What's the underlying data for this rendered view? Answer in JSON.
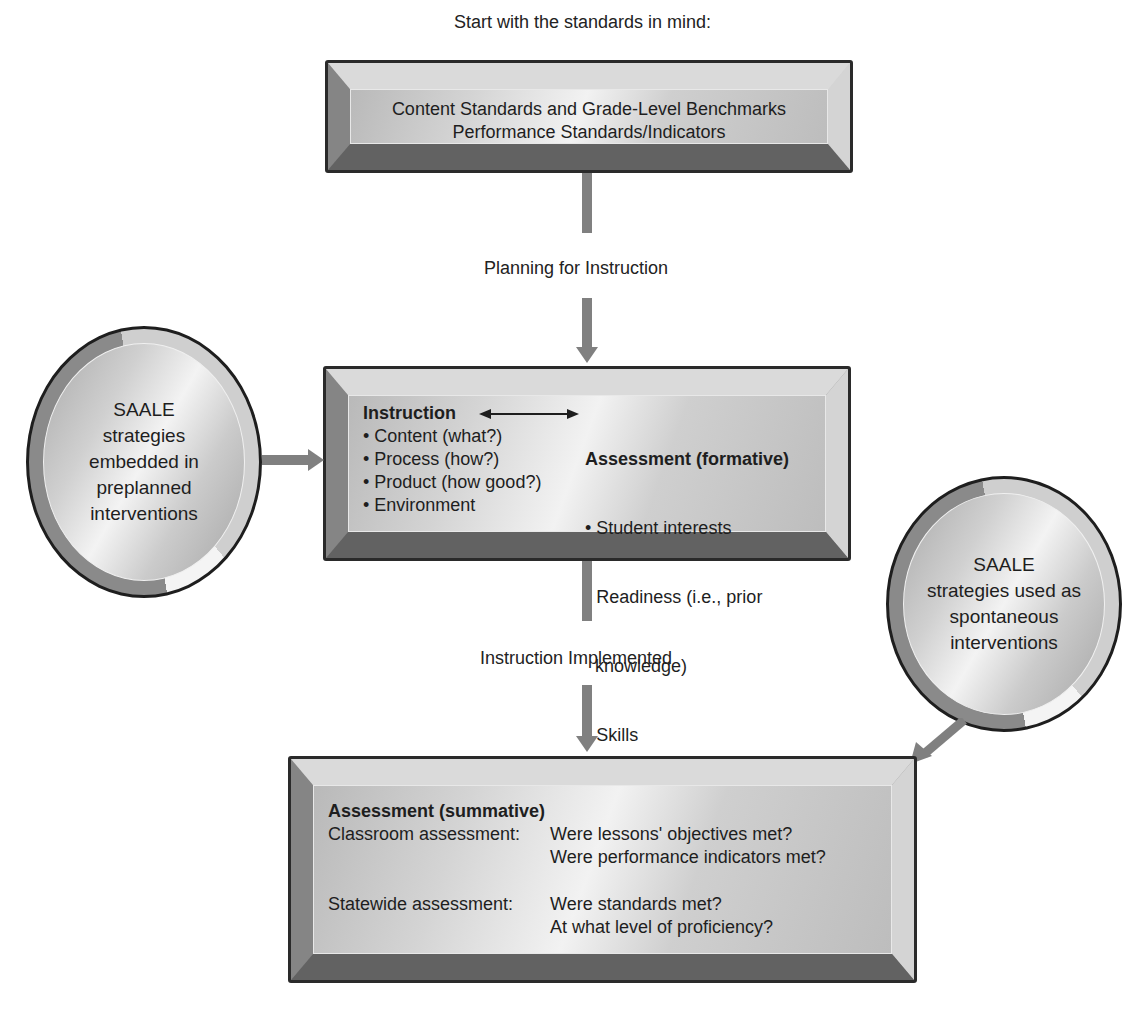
{
  "diagram": {
    "top_caption": "Start with the standards in mind:",
    "top_box": {
      "lines": [
        "Content Standards and Grade-Level Benchmarks",
        "Performance Standards/Indicators"
      ]
    },
    "connector_1_label": "Planning for Instruction",
    "middle_box": {
      "left_heading": "Instruction",
      "left_items": [
        "• Content (what?)",
        "• Process (how?)",
        "• Product (how good?)",
        "• Environment"
      ],
      "right_heading": "Assessment (formative)",
      "right_items": [
        "• Student interests",
        "• Readiness (i.e., prior",
        "  knowledge)",
        "• Skills"
      ]
    },
    "connector_2_label": "Instruction Implemented",
    "bottom_box": {
      "heading": "Assessment (summative)",
      "rows": [
        {
          "label": "Classroom assessment:",
          "questions": [
            "Were lessons' objectives met?",
            "Were performance indicators met?"
          ]
        },
        {
          "label": "Statewide assessment:",
          "questions": [
            "Were standards met?",
            "At what level of proficiency?"
          ]
        }
      ]
    },
    "left_circle": {
      "lines": [
        "SAALE",
        "strategies",
        "embedded in",
        "preplanned",
        "interventions"
      ]
    },
    "right_circle": {
      "lines": [
        "SAALE",
        "strategies used as",
        "spontaneous",
        "interventions"
      ]
    },
    "colors": {
      "connector": "#808080",
      "box_border": "#2a2a2a",
      "text": "#1e1e1e"
    }
  }
}
